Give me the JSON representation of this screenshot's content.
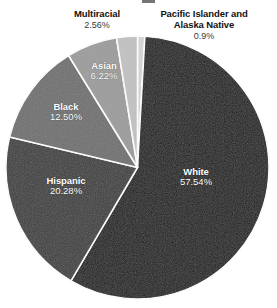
{
  "chart_data": {
    "type": "pie",
    "title": "",
    "categories": [
      "Pacific Islander and Alaska Native",
      "White",
      "Hispanic",
      "Black",
      "Asian",
      "Multiracial"
    ],
    "values": [
      0.9,
      57.54,
      20.28,
      12.5,
      6.22,
      2.56
    ],
    "value_labels": [
      "0.9%",
      "57.54%",
      "20.28%",
      "12.50%",
      "6.22%",
      "2.56%"
    ],
    "colors": [
      "#d6d6d6",
      "#1b1b1b",
      "#3e3e3e",
      "#707070",
      "#9c9c9c",
      "#c2c2c2"
    ],
    "label_placement": [
      "outside",
      "inside",
      "inside",
      "inside",
      "inside",
      "outside"
    ],
    "legend": "none",
    "grid": false,
    "start_angle_deg": 0,
    "direction": "clockwise",
    "slice_border_color": "#ffffff",
    "xlabel": "",
    "ylabel": ""
  },
  "slices": {
    "pacific": {
      "name": "Pacific Islander and\nAlaska Native",
      "pct": "0.9%",
      "color": "#d6d6d6"
    },
    "white": {
      "name": "White",
      "pct": "57.54%",
      "color": "#1b1b1b"
    },
    "hispanic": {
      "name": "Hispanic",
      "pct": "20.28%",
      "color": "#3e3e3e"
    },
    "black": {
      "name": "Black",
      "pct": "12.50%",
      "color": "#707070"
    },
    "asian": {
      "name": "Asian",
      "pct": "6.22%",
      "color": "#9c9c9c"
    },
    "multiracial": {
      "name": "Multiracial",
      "pct": "2.56%",
      "color": "#c2c2c2"
    }
  }
}
